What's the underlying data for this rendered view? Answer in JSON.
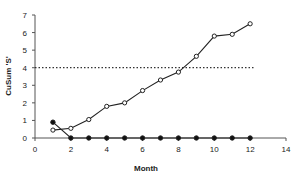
{
  "chart_data": {
    "type": "line",
    "title": "",
    "xlabel": "Month",
    "ylabel": "CuSum 'S'",
    "xlim": [
      0,
      14
    ],
    "ylim": [
      0,
      7
    ],
    "xticks": [
      0,
      2,
      4,
      6,
      8,
      10,
      12,
      14
    ],
    "yticks": [
      0,
      1,
      2,
      3,
      4,
      5,
      6,
      7
    ],
    "grid": false,
    "legend": null,
    "series": [
      {
        "name": "CuSum upper (open circles)",
        "marker": "open-circle",
        "x": [
          1,
          2,
          3,
          4,
          5,
          6,
          7,
          8,
          9,
          10,
          11,
          12
        ],
        "values": [
          0.45,
          0.55,
          1.05,
          1.8,
          2.0,
          2.7,
          3.3,
          3.75,
          4.65,
          5.8,
          5.9,
          6.5
        ]
      },
      {
        "name": "CuSum lower (filled circles)",
        "marker": "filled-circle",
        "x": [
          1,
          2,
          3,
          4,
          5,
          6,
          7,
          8,
          9,
          10,
          11,
          12
        ],
        "values": [
          0.9,
          0,
          0,
          0,
          0,
          0,
          0,
          0,
          0,
          0,
          0,
          0
        ]
      }
    ],
    "annotations": [
      {
        "type": "hline",
        "y": 4,
        "x_from": 0,
        "x_to": 12.2,
        "style": "dotted",
        "label": "decision interval"
      }
    ]
  },
  "colors": {
    "axis": "#555555",
    "line": "#222222",
    "marker_fill_open": "#ffffff",
    "marker_fill_filled": "#111111",
    "threshold": "#333333"
  }
}
